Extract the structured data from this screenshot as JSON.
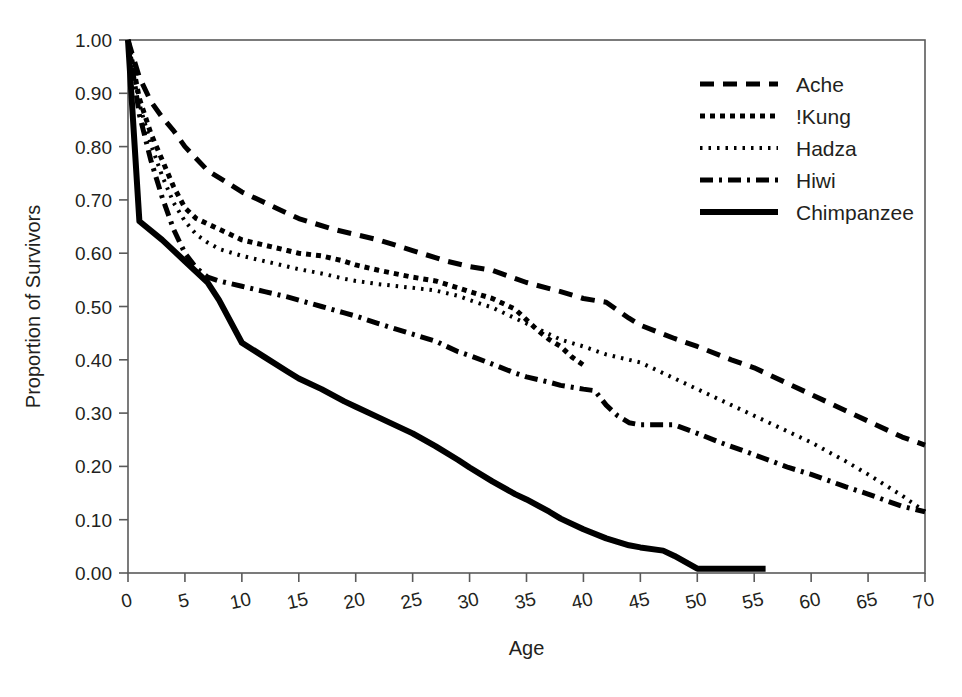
{
  "chart_data": {
    "type": "line",
    "title": "",
    "xlabel": "Age",
    "ylabel": "Proportion of Survivors",
    "xlim": [
      0,
      70
    ],
    "ylim": [
      0.0,
      1.0
    ],
    "xticks": [
      0,
      5,
      10,
      15,
      20,
      25,
      30,
      35,
      40,
      45,
      50,
      55,
      60,
      65,
      70
    ],
    "xtick_labels": [
      "0",
      "5",
      "10",
      "15",
      "20",
      "25",
      "30",
      "35",
      "40",
      "45",
      "50",
      "55",
      "60",
      "65",
      "70"
    ],
    "yticks": [
      0.0,
      0.1,
      0.2,
      0.3,
      0.4,
      0.5,
      0.6,
      0.7,
      0.8,
      0.9,
      1.0
    ],
    "ytick_labels": [
      "0.00",
      "0.10",
      "0.20",
      "0.30",
      "0.40",
      "0.50",
      "0.60",
      "0.70",
      "0.80",
      "0.90",
      "1.00"
    ],
    "grid": false,
    "legend_position": "top-right",
    "frame": true,
    "series": [
      {
        "name": "Ache",
        "style": "dashed",
        "color": "#000000",
        "dasharray": "14,9",
        "width": 5,
        "points": [
          [
            0,
            1.0
          ],
          [
            1,
            0.93
          ],
          [
            2,
            0.885
          ],
          [
            3,
            0.855
          ],
          [
            4,
            0.83
          ],
          [
            5,
            0.8
          ],
          [
            7,
            0.755
          ],
          [
            10,
            0.715
          ],
          [
            13,
            0.685
          ],
          [
            15,
            0.665
          ],
          [
            18,
            0.645
          ],
          [
            20,
            0.635
          ],
          [
            22,
            0.625
          ],
          [
            25,
            0.605
          ],
          [
            28,
            0.585
          ],
          [
            30,
            0.575
          ],
          [
            32,
            0.568
          ],
          [
            35,
            0.545
          ],
          [
            38,
            0.528
          ],
          [
            40,
            0.515
          ],
          [
            42,
            0.508
          ],
          [
            44,
            0.478
          ],
          [
            45,
            0.465
          ],
          [
            48,
            0.44
          ],
          [
            50,
            0.425
          ],
          [
            53,
            0.4
          ],
          [
            55,
            0.385
          ],
          [
            58,
            0.355
          ],
          [
            60,
            0.335
          ],
          [
            63,
            0.305
          ],
          [
            65,
            0.285
          ],
          [
            68,
            0.255
          ],
          [
            70,
            0.24
          ]
        ]
      },
      {
        "name": "!Kung",
        "style": "dotted-thick",
        "color": "#000000",
        "dasharray": "5,5",
        "width": 5,
        "points": [
          [
            0,
            1.0
          ],
          [
            1,
            0.89
          ],
          [
            2,
            0.825
          ],
          [
            3,
            0.775
          ],
          [
            4,
            0.725
          ],
          [
            5,
            0.685
          ],
          [
            6,
            0.665
          ],
          [
            7,
            0.655
          ],
          [
            8,
            0.645
          ],
          [
            10,
            0.625
          ],
          [
            12,
            0.615
          ],
          [
            14,
            0.605
          ],
          [
            15,
            0.6
          ],
          [
            17,
            0.595
          ],
          [
            19,
            0.585
          ],
          [
            20,
            0.578
          ],
          [
            22,
            0.568
          ],
          [
            25,
            0.555
          ],
          [
            27,
            0.548
          ],
          [
            29,
            0.535
          ],
          [
            30,
            0.528
          ],
          [
            32,
            0.515
          ],
          [
            33,
            0.505
          ],
          [
            34,
            0.495
          ],
          [
            35,
            0.475
          ],
          [
            36,
            0.455
          ],
          [
            37,
            0.438
          ],
          [
            38,
            0.425
          ],
          [
            39,
            0.405
          ],
          [
            40,
            0.39
          ]
        ]
      },
      {
        "name": "Hadza",
        "style": "dotted-fine",
        "color": "#000000",
        "dasharray": "2.5,6",
        "width": 4,
        "points": [
          [
            0,
            1.0
          ],
          [
            1,
            0.88
          ],
          [
            2,
            0.805
          ],
          [
            3,
            0.745
          ],
          [
            4,
            0.695
          ],
          [
            5,
            0.66
          ],
          [
            6,
            0.635
          ],
          [
            7,
            0.62
          ],
          [
            8,
            0.608
          ],
          [
            10,
            0.595
          ],
          [
            12,
            0.585
          ],
          [
            14,
            0.575
          ],
          [
            15,
            0.57
          ],
          [
            17,
            0.562
          ],
          [
            19,
            0.552
          ],
          [
            20,
            0.548
          ],
          [
            22,
            0.542
          ],
          [
            25,
            0.535
          ],
          [
            27,
            0.53
          ],
          [
            29,
            0.52
          ],
          [
            30,
            0.512
          ],
          [
            32,
            0.498
          ],
          [
            34,
            0.478
          ],
          [
            35,
            0.468
          ],
          [
            37,
            0.448
          ],
          [
            38,
            0.438
          ],
          [
            40,
            0.425
          ],
          [
            42,
            0.41
          ],
          [
            44,
            0.4
          ],
          [
            45,
            0.395
          ],
          [
            48,
            0.365
          ],
          [
            50,
            0.345
          ],
          [
            53,
            0.315
          ],
          [
            55,
            0.295
          ],
          [
            58,
            0.265
          ],
          [
            60,
            0.245
          ],
          [
            63,
            0.21
          ],
          [
            65,
            0.185
          ],
          [
            68,
            0.145
          ],
          [
            70,
            0.115
          ]
        ]
      },
      {
        "name": "Hiwi",
        "style": "dash-dot",
        "color": "#000000",
        "dasharray": "13,6,3,6",
        "width": 5,
        "points": [
          [
            0,
            1.0
          ],
          [
            1,
            0.86
          ],
          [
            2,
            0.775
          ],
          [
            3,
            0.705
          ],
          [
            4,
            0.645
          ],
          [
            5,
            0.6
          ],
          [
            6,
            0.572
          ],
          [
            7,
            0.555
          ],
          [
            8,
            0.548
          ],
          [
            10,
            0.538
          ],
          [
            12,
            0.528
          ],
          [
            14,
            0.518
          ],
          [
            15,
            0.512
          ],
          [
            17,
            0.5
          ],
          [
            19,
            0.488
          ],
          [
            20,
            0.482
          ],
          [
            22,
            0.468
          ],
          [
            25,
            0.448
          ],
          [
            27,
            0.435
          ],
          [
            29,
            0.415
          ],
          [
            30,
            0.408
          ],
          [
            32,
            0.392
          ],
          [
            34,
            0.375
          ],
          [
            35,
            0.368
          ],
          [
            37,
            0.358
          ],
          [
            38,
            0.352
          ],
          [
            40,
            0.345
          ],
          [
            41,
            0.342
          ],
          [
            42,
            0.315
          ],
          [
            43,
            0.295
          ],
          [
            44,
            0.282
          ],
          [
            45,
            0.278
          ],
          [
            47,
            0.278
          ],
          [
            48,
            0.278
          ],
          [
            50,
            0.262
          ],
          [
            52,
            0.245
          ],
          [
            55,
            0.222
          ],
          [
            58,
            0.198
          ],
          [
            60,
            0.185
          ],
          [
            63,
            0.162
          ],
          [
            65,
            0.148
          ],
          [
            68,
            0.125
          ],
          [
            70,
            0.115
          ]
        ]
      },
      {
        "name": "Chimpanzee",
        "style": "solid",
        "color": "#000000",
        "dasharray": "",
        "width": 6,
        "points": [
          [
            0,
            1.0
          ],
          [
            1,
            0.66
          ],
          [
            3,
            0.625
          ],
          [
            5,
            0.585
          ],
          [
            7,
            0.545
          ],
          [
            8,
            0.512
          ],
          [
            10,
            0.432
          ],
          [
            12,
            0.405
          ],
          [
            14,
            0.378
          ],
          [
            15,
            0.365
          ],
          [
            17,
            0.345
          ],
          [
            19,
            0.322
          ],
          [
            20,
            0.312
          ],
          [
            22,
            0.292
          ],
          [
            25,
            0.262
          ],
          [
            27,
            0.238
          ],
          [
            29,
            0.212
          ],
          [
            30,
            0.198
          ],
          [
            32,
            0.172
          ],
          [
            34,
            0.148
          ],
          [
            35,
            0.138
          ],
          [
            37,
            0.115
          ],
          [
            38,
            0.102
          ],
          [
            40,
            0.082
          ],
          [
            42,
            0.065
          ],
          [
            44,
            0.052
          ],
          [
            45,
            0.048
          ],
          [
            47,
            0.042
          ],
          [
            48,
            0.032
          ],
          [
            50,
            0.008
          ],
          [
            53,
            0.008
          ],
          [
            56,
            0.008
          ]
        ]
      }
    ]
  },
  "legend": {
    "items": [
      {
        "label": "Ache"
      },
      {
        "label": "!Kung"
      },
      {
        "label": "Hadza"
      },
      {
        "label": "Hiwi"
      },
      {
        "label": "Chimpanzee"
      }
    ]
  }
}
